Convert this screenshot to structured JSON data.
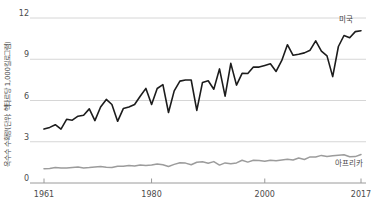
{
  "chart_data": {
    "type": "line",
    "title": "",
    "ylabel": "옥수수 수확량(단위: 헥타르당 1,000킬로그램)",
    "xlabel": "",
    "x_range": [
      1961,
      2017
    ],
    "ylim": [
      0,
      12
    ],
    "x_ticks": [
      1961,
      1980,
      2000,
      2017
    ],
    "y_ticks": [
      0,
      3,
      6,
      9,
      12
    ],
    "grid": "horizontal",
    "legend_position": "inline-end-labels",
    "colors": {
      "grid": "#d6d6d6",
      "axis": "#9a9a9a",
      "tick_text": "#4b4b4b",
      "background": "#ffffff"
    },
    "series": [
      {
        "name": "미국",
        "color": "#1c1c1c",
        "stroke_width": 1.6,
        "values": [
          3.92,
          4.04,
          4.24,
          3.92,
          4.63,
          4.57,
          4.86,
          4.93,
          5.39,
          4.54,
          5.53,
          6.08,
          5.71,
          4.49,
          5.41,
          5.52,
          5.71,
          6.31,
          6.88,
          5.71,
          6.87,
          7.15,
          5.13,
          6.7,
          7.41,
          7.49,
          7.49,
          5.28,
          7.32,
          7.44,
          6.82,
          8.3,
          6.32,
          8.7,
          7.12,
          7.98,
          7.96,
          8.44,
          8.43,
          8.55,
          8.67,
          8.12,
          8.92,
          10.06,
          9.29,
          9.36,
          9.46,
          9.66,
          10.34,
          9.59,
          9.24,
          7.74,
          9.93,
          10.73,
          10.57,
          11.01,
          11.08
        ]
      },
      {
        "name": "아프리카",
        "color": "#9c9c9c",
        "stroke_width": 1.5,
        "values": [
          1.04,
          1.06,
          1.12,
          1.09,
          1.09,
          1.13,
          1.16,
          1.1,
          1.13,
          1.17,
          1.21,
          1.15,
          1.12,
          1.22,
          1.22,
          1.28,
          1.23,
          1.31,
          1.27,
          1.3,
          1.38,
          1.32,
          1.2,
          1.35,
          1.47,
          1.45,
          1.32,
          1.51,
          1.55,
          1.44,
          1.56,
          1.3,
          1.46,
          1.4,
          1.46,
          1.66,
          1.52,
          1.65,
          1.63,
          1.58,
          1.66,
          1.62,
          1.68,
          1.73,
          1.67,
          1.82,
          1.71,
          1.9,
          1.89,
          2.01,
          1.92,
          1.98,
          2.02,
          2.06,
          1.91,
          1.92,
          2.07
        ]
      }
    ]
  }
}
